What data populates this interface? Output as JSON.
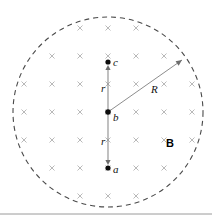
{
  "figure": {
    "title": "",
    "type": "physics-diagram",
    "field_region": {
      "shape": "circle",
      "boundary_style": "dashed",
      "center": {
        "x": 108,
        "y": 112
      },
      "radius": 95,
      "radius_label": "R",
      "field_label": "B",
      "field_direction": "into-page",
      "field_marker_glyph": "x",
      "field_marker_color": "#b9b9b9",
      "boundary_color": "#4a4a4a"
    },
    "points": [
      {
        "id": "point-c",
        "label": "c",
        "x": 108,
        "y": 62
      },
      {
        "id": "point-b",
        "label": "b",
        "x": 108,
        "y": 112
      },
      {
        "id": "point-a",
        "label": "a",
        "x": 108,
        "y": 168
      }
    ],
    "distance_labels": [
      {
        "id": "distance-bc",
        "label": "r",
        "x": 101,
        "y": 92
      },
      {
        "id": "distance-ba",
        "label": "r",
        "x": 101,
        "y": 145
      }
    ],
    "radius_annotation": {
      "label": "R",
      "label_x": 151,
      "label_y": 93,
      "from": {
        "x": 108,
        "y": 112
      },
      "to": {
        "x": 182,
        "y": 60
      }
    },
    "field_label_annotation": {
      "label": "B",
      "x": 166,
      "y": 147
    },
    "cross_grid": {
      "spacing": 28,
      "origin_x": 24,
      "origin_y": 28,
      "size": 5,
      "columns": 7,
      "rows": 7
    },
    "footer_rule": {
      "y": 214,
      "color": "#9a9a9a"
    }
  }
}
